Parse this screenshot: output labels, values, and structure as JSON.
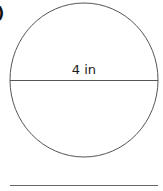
{
  "problem_label": ")",
  "figure": {
    "shape": "circle",
    "diameter_label": "4 in",
    "measurement": {
      "value": 4,
      "unit": "in",
      "type": "diameter"
    }
  },
  "answer_line": {
    "text": ""
  }
}
